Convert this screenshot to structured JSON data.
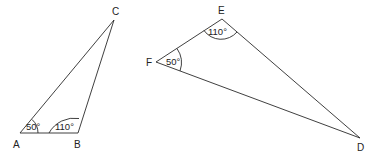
{
  "diagram": {
    "triangles": [
      {
        "name": "ABC",
        "vertices": {
          "A": {
            "label": "A",
            "x": 20,
            "y": 133
          },
          "B": {
            "label": "B",
            "x": 78,
            "y": 133
          },
          "C": {
            "label": "C",
            "x": 114,
            "y": 20
          }
        },
        "angles": [
          {
            "at": "A",
            "value": "50°"
          },
          {
            "at": "B",
            "value": "110°"
          }
        ]
      },
      {
        "name": "DEF",
        "vertices": {
          "E": {
            "label": "E",
            "x": 222,
            "y": 19
          },
          "F": {
            "label": "F",
            "x": 156,
            "y": 62
          },
          "D": {
            "label": "D",
            "x": 360,
            "y": 138
          }
        },
        "angles": [
          {
            "at": "E",
            "value": "110°"
          },
          {
            "at": "F",
            "value": "50°"
          }
        ]
      }
    ]
  }
}
